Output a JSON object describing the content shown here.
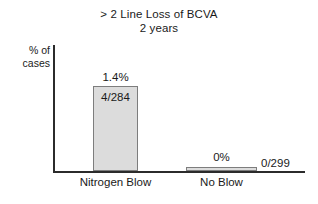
{
  "chart_data": {
    "type": "bar",
    "title": "> 2 Line Loss of BCVA\n2 years",
    "title_lines": [
      "> 2 Line Loss of BCVA",
      "2 years"
    ],
    "categories": [
      "Nitrogen Blow",
      "No Blow"
    ],
    "values": [
      1.4,
      0
    ],
    "value_labels": [
      "1.4%",
      "0%"
    ],
    "count_labels": [
      "4/284",
      "0/299"
    ],
    "counts": [
      {
        "events": 4,
        "total": 284
      },
      {
        "events": 0,
        "total": 299
      }
    ],
    "xlabel": "",
    "ylabel": "% of cases",
    "ylabel_lines": [
      "% of",
      "cases"
    ],
    "ylim": [
      0,
      2.1
    ],
    "grid": false,
    "legend": false,
    "colors": {
      "bar_fill": "#dcdcdc",
      "bar_border": "#7d7d7d",
      "axis": "#2b2b2b",
      "text": "#1a1a1a",
      "background": "#ffffff"
    }
  },
  "title": {
    "line1": "> 2 Line Loss of BCVA",
    "line2": "2 years"
  },
  "yaxis": {
    "label_line1": "% of",
    "label_line2": "cases"
  },
  "bars": {
    "nitrogen_blow": {
      "category": "Nitrogen Blow",
      "value_label": "1.4%",
      "count_label": "4/284"
    },
    "no_blow": {
      "category": "No Blow",
      "value_label": "0%",
      "count_label": "0/299"
    }
  }
}
